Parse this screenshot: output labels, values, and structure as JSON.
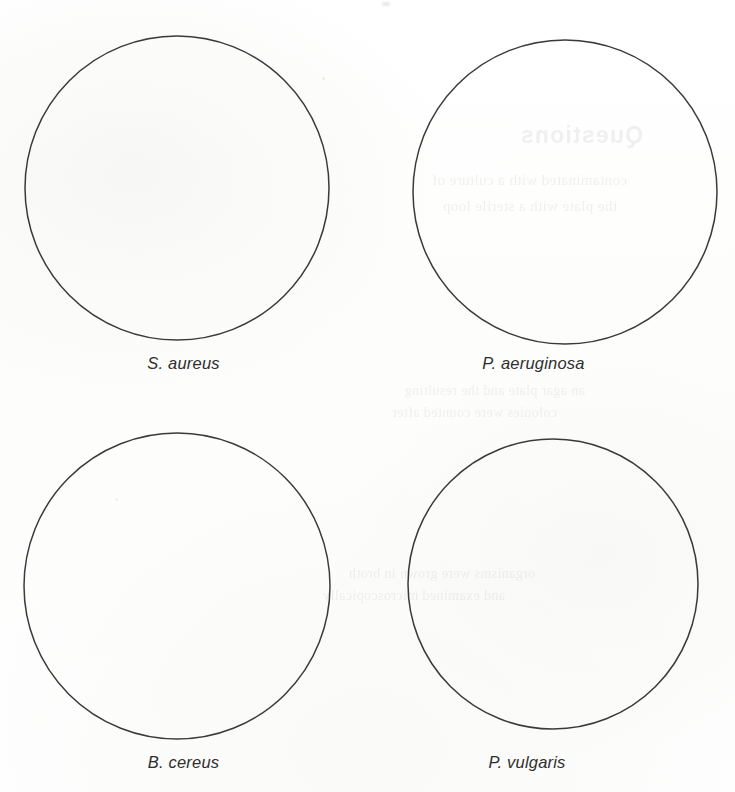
{
  "figure": {
    "kind": "scanned-textbook-figure",
    "background_color": "#fefefe",
    "outline_color": "#3a3a3a",
    "label_color": "#2e2e2e"
  },
  "panels": [
    {
      "id": "s-aureus",
      "label": "S. aureus",
      "position": "top-left",
      "circle": {
        "cx": 153,
        "cy": 154,
        "r": 152
      }
    },
    {
      "id": "p-aeruginosa",
      "label": "P. aeruginosa",
      "position": "top-right",
      "circle": {
        "cx": 157,
        "cy": 154,
        "r": 152
      }
    },
    {
      "id": "b-cereus",
      "label": "B. cereus",
      "position": "bottom-left",
      "circle": {
        "cx": 153,
        "cy": 156,
        "r": 153
      }
    },
    {
      "id": "p-vulgaris",
      "label": "P. vulgaris",
      "position": "bottom-right",
      "circle": {
        "cx": 145,
        "cy": 154,
        "r": 145
      }
    }
  ],
  "bleed_through": {
    "note": "Mirror-reversed show-through text from the reverse side of the scanned page; illegible at this contrast.",
    "lines": [
      {
        "text": "Questions",
        "x": 92,
        "y": 122,
        "size": 23,
        "heading": true
      },
      {
        "text": "contaminated with a culture of",
        "x": 108,
        "y": 172,
        "size": 15,
        "heading": false
      },
      {
        "text": "the plate with a sterile loop",
        "x": 118,
        "y": 198,
        "size": 15,
        "heading": false
      },
      {
        "text": "an agar plate and the resulting",
        "x": 150,
        "y": 383,
        "size": 14,
        "heading": false
      },
      {
        "text": "colonies were counted after",
        "x": 178,
        "y": 405,
        "size": 14,
        "heading": false
      },
      {
        "text": "organisms were grown in broth",
        "x": 200,
        "y": 566,
        "size": 14,
        "heading": false
      },
      {
        "text": "and examined microscopically",
        "x": 230,
        "y": 588,
        "size": 14,
        "heading": false
      }
    ]
  }
}
